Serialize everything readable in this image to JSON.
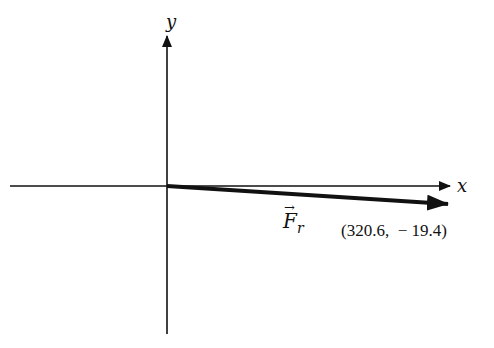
{
  "diagram": {
    "type": "vector-on-cartesian-axes",
    "axes": {
      "x_label": "x",
      "y_label": "y"
    },
    "vector": {
      "name": "F_r",
      "label_main": "F",
      "label_sub": "r",
      "label_arrow": "→",
      "components": {
        "x": 320.6,
        "y": -19.4
      },
      "coordinate_label": "(320.6,  − 19.4)"
    },
    "colors": {
      "background": "#ffffff",
      "ink": "#111111"
    }
  }
}
